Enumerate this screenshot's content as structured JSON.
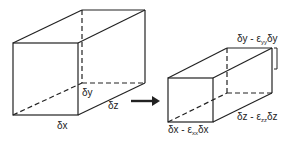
{
  "diagram": {
    "type": "strain-deformation-of-volume-element",
    "before": {
      "labels": {
        "x": "δx",
        "y": "δy",
        "z": "δz"
      }
    },
    "arrow": "right-arrow",
    "after": {
      "labels": {
        "x_main": "δx - ε",
        "x_sub": "xx",
        "x_tail": "δx",
        "y_main": "δy - ε",
        "y_sub": "yy",
        "y_tail": "δy",
        "z_main": "δz - ε",
        "z_sub": "zz",
        "z_tail": "δz"
      }
    },
    "colors": {
      "stroke": "#222222",
      "background": "#ffffff"
    }
  }
}
